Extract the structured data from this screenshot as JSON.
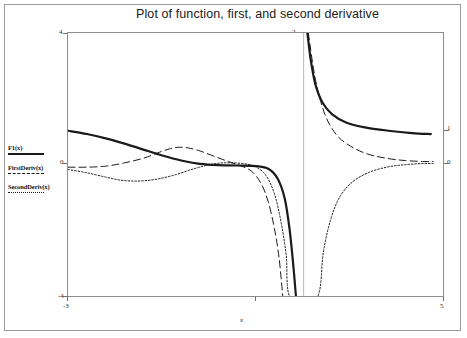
{
  "title": "Plot of function, first, and second derivative",
  "axis": {
    "x_label": "x",
    "x_ticks": [
      "-3",
      "1",
      "5"
    ],
    "y_ticks_left": [
      "4",
      "0",
      "-4"
    ],
    "y_ticks_right": [
      "2",
      "1",
      "0"
    ]
  },
  "legend": {
    "entries": [
      {
        "label": "F1(x)",
        "style": "solid"
      },
      {
        "label": "FirstDeriv(x)",
        "style": "long-dash"
      },
      {
        "label": "SecondDeriv(x)",
        "style": "dotted"
      }
    ]
  },
  "colors": {
    "curve": "#1a1a1a",
    "frame": "#8d8d8d",
    "outer_frame": "#9a9a9a",
    "background": "#ffffff",
    "text": "#1b1b1b"
  },
  "chart_data": {
    "type": "line",
    "title": "Plot of function, first, and second derivative",
    "xlabel": "x",
    "ylabel": "",
    "xlim": [
      -3,
      5
    ],
    "ylim": [
      -4,
      4
    ],
    "grid": false,
    "legend_position": "left-outside",
    "asymptote_x": 2,
    "x_ticks": [
      -3,
      1,
      5
    ],
    "y_ticks": [
      -4,
      0,
      4
    ],
    "series": [
      {
        "name": "F1(x)",
        "style": "solid",
        "width": 2.2,
        "points": [
          [
            -3.0,
            1.05
          ],
          [
            -2.6,
            0.95
          ],
          [
            -2.2,
            0.82
          ],
          [
            -1.8,
            0.66
          ],
          [
            -1.4,
            0.48
          ],
          [
            -1.0,
            0.3
          ],
          [
            -0.6,
            0.15
          ],
          [
            -0.2,
            0.05
          ],
          [
            0.2,
            0.01
          ],
          [
            0.6,
            0.0
          ],
          [
            1.0,
            -0.02
          ],
          [
            1.25,
            -0.1
          ],
          [
            1.45,
            -0.4
          ],
          [
            1.6,
            -1.0
          ],
          [
            1.7,
            -1.9
          ],
          [
            1.78,
            -3.0
          ],
          [
            1.84,
            -4.0
          ],
          [
            2.08,
            4.0
          ],
          [
            2.15,
            3.2
          ],
          [
            2.25,
            2.45
          ],
          [
            2.4,
            1.9
          ],
          [
            2.6,
            1.55
          ],
          [
            2.9,
            1.3
          ],
          [
            3.3,
            1.15
          ],
          [
            3.8,
            1.05
          ],
          [
            4.3,
            0.98
          ],
          [
            4.7,
            0.95
          ]
        ]
      },
      {
        "name": "FirstDeriv(x)",
        "style": "long-dash",
        "width": 1.0,
        "points": [
          [
            -3.0,
            -0.05
          ],
          [
            -2.6,
            -0.05
          ],
          [
            -2.2,
            -0.02
          ],
          [
            -1.8,
            0.08
          ],
          [
            -1.4,
            0.22
          ],
          [
            -1.1,
            0.38
          ],
          [
            -0.85,
            0.5
          ],
          [
            -0.65,
            0.55
          ],
          [
            -0.45,
            0.53
          ],
          [
            -0.2,
            0.44
          ],
          [
            0.1,
            0.28
          ],
          [
            0.4,
            0.12
          ],
          [
            0.65,
            0.0
          ],
          [
            0.9,
            -0.18
          ],
          [
            1.1,
            -0.55
          ],
          [
            1.25,
            -1.1
          ],
          [
            1.38,
            -1.9
          ],
          [
            1.48,
            -2.8
          ],
          [
            1.56,
            -4.0
          ],
          [
            2.1,
            4.0
          ],
          [
            2.25,
            2.6
          ],
          [
            2.45,
            1.55
          ],
          [
            2.7,
            0.92
          ],
          [
            3.0,
            0.58
          ],
          [
            3.35,
            0.35
          ],
          [
            3.75,
            0.22
          ],
          [
            4.15,
            0.15
          ],
          [
            4.55,
            0.12
          ],
          [
            4.75,
            0.12
          ]
        ]
      },
      {
        "name": "SecondDeriv(x)",
        "style": "dotted",
        "width": 1.0,
        "points": [
          [
            -3.0,
            -0.12
          ],
          [
            -2.6,
            -0.22
          ],
          [
            -2.2,
            -0.35
          ],
          [
            -1.9,
            -0.44
          ],
          [
            -1.6,
            -0.47
          ],
          [
            -1.3,
            -0.45
          ],
          [
            -1.0,
            -0.38
          ],
          [
            -0.7,
            -0.27
          ],
          [
            -0.4,
            -0.13
          ],
          [
            -0.1,
            -0.01
          ],
          [
            0.2,
            0.07
          ],
          [
            0.5,
            0.08
          ],
          [
            0.8,
            0.04
          ],
          [
            1.0,
            -0.05
          ],
          [
            1.2,
            -0.3
          ],
          [
            1.38,
            -0.85
          ],
          [
            1.52,
            -1.7
          ],
          [
            1.63,
            -2.7
          ],
          [
            1.72,
            -4.0
          ],
          [
            2.28,
            -4.0
          ],
          [
            2.42,
            -2.6
          ],
          [
            2.58,
            -1.6
          ],
          [
            2.78,
            -0.92
          ],
          [
            3.05,
            -0.48
          ],
          [
            3.4,
            -0.2
          ],
          [
            3.8,
            -0.04
          ],
          [
            4.2,
            0.03
          ],
          [
            4.55,
            0.06
          ],
          [
            4.75,
            0.06
          ]
        ]
      }
    ]
  }
}
